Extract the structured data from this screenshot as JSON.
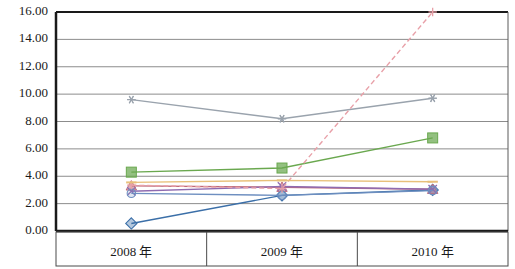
{
  "chart_data": {
    "type": "line",
    "title": "",
    "xlabel": "",
    "ylabel": "",
    "categories": [
      "2008 年",
      "2009 年",
      "2010 年"
    ],
    "ylim": [
      0.0,
      16.0
    ],
    "ytick_step": 2.0,
    "ytick_labels": [
      "0.00",
      "2.00",
      "4.00",
      "6.00",
      "8.00",
      "10.00",
      "12.00",
      "14.00",
      "16.00"
    ],
    "ytick_values": [
      0.0,
      2.0,
      4.0,
      6.0,
      8.0,
      10.0,
      12.0,
      14.0,
      16.0
    ],
    "grid": true,
    "grid_axis": "y",
    "legend": "none",
    "series": [
      {
        "name": "series-1",
        "marker": "diamond",
        "color": "#3b6fa8",
        "dash": "solid",
        "values": [
          0.55,
          2.6,
          3.0
        ]
      },
      {
        "name": "series-2",
        "marker": "square",
        "color": "#6aa84f",
        "dash": "solid",
        "values": [
          4.3,
          4.6,
          6.8
        ]
      },
      {
        "name": "series-3",
        "marker": "triangle",
        "color": "#c06b7a",
        "dash": "solid",
        "values": [
          3.3,
          3.2,
          3.05
        ]
      },
      {
        "name": "series-4",
        "marker": "x",
        "color": "#8f6bb0",
        "dash": "solid",
        "values": [
          2.9,
          3.25,
          3.05
        ]
      },
      {
        "name": "series-5",
        "marker": "asterisk",
        "color": "#9aa3ad",
        "dash": "solid",
        "values": [
          9.6,
          8.2,
          9.7
        ]
      },
      {
        "name": "series-6",
        "marker": "circle",
        "color": "#6e8fc0",
        "dash": "solid",
        "values": [
          2.75,
          2.6,
          2.95
        ]
      },
      {
        "name": "series-7",
        "marker": "plus",
        "color": "#e8a0a8",
        "dash": "dashed",
        "values": [
          3.35,
          3.1,
          16.0
        ]
      },
      {
        "name": "series-8",
        "marker": "dash",
        "color": "#e8c07a",
        "dash": "solid",
        "values": [
          3.55,
          3.7,
          3.6
        ]
      }
    ]
  },
  "axis": {
    "yaxis_name": "value-axis",
    "xaxis_name": "category-axis"
  }
}
